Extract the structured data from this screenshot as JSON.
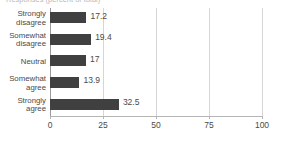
{
  "title_fragment": "Responses (percent of total)",
  "chart_data": {
    "type": "bar",
    "orientation": "horizontal",
    "title": "",
    "xlabel": "",
    "ylabel": "",
    "categories": [
      "Strongly disagree",
      "Somewhat disagree",
      "Neutral",
      "Somewhat agree",
      "Strongly agree"
    ],
    "values": [
      17.2,
      19.4,
      17,
      13.9,
      32.5
    ],
    "data_labels": [
      "17.2",
      "19.4",
      "17",
      "13.9",
      "32.5"
    ],
    "xlim": [
      0,
      100
    ],
    "xticks": [
      0,
      25,
      50,
      75,
      100
    ],
    "xtick_labels": [
      "0",
      "25",
      "50",
      "75",
      "100"
    ],
    "grid": true,
    "grid_axis": "x",
    "legend": false,
    "bar_color": "#404040",
    "gridline_color": "#d6d6d6",
    "axis_color": "#9a9a9a",
    "label_color": "#4a4a4a"
  },
  "category_lines": [
    [
      "Strongly",
      "disagree"
    ],
    [
      "Somewhat",
      "disagree"
    ],
    [
      "Neutral",
      ""
    ],
    [
      "Somewhat",
      "agree"
    ],
    [
      "Strongly",
      "agree"
    ]
  ]
}
